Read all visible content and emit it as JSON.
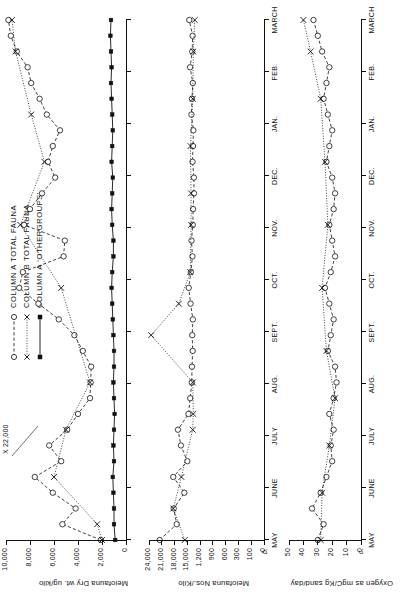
{
  "figure": {
    "legend": [
      {
        "id": "col-a-total",
        "label": "COLUMN A TOTAL  FAUNA",
        "style": "open-circle-dashed"
      },
      {
        "id": "col-b-total",
        "label": "COLUMN B TOTAL  FAUNA",
        "style": "cross-dotted"
      },
      {
        "id": "col-a-other",
        "label": "COLUMN A  ‘OTHERGROUPS’",
        "style": "filled-square-solid"
      }
    ],
    "annotation": {
      "text": "X 22,000",
      "panel": "a"
    },
    "panel_letters": {
      "b": "b.",
      "c": "c."
    }
  },
  "chart_data": [
    {
      "type": "line",
      "panel": "a",
      "title": "",
      "ylabel": "Meiofauna Dry wt. ug/kilo",
      "xlabel": "",
      "grid": false,
      "legend_position": "top-left",
      "ylim": [
        0,
        10500
      ],
      "yticks": [
        0,
        2000,
        4000,
        6000,
        8000,
        10000
      ],
      "ytick_labels": [
        "0",
        "2,000",
        "4,000",
        "6,000",
        "8,000",
        "10,000"
      ],
      "x": [
        "MAY",
        "JUNE",
        "JULY",
        "AUG.",
        "SEPT.",
        "OCT.",
        "NOV.",
        "DEC.",
        "JAN.",
        "FEB.",
        "MARCH"
      ],
      "xtick_labels": [
        "MAY",
        "JUNE",
        "JULY",
        "AUG.",
        "SEPT.",
        "OCT.",
        "NOV.",
        "DEC.",
        "JAN.",
        "FEB.",
        "MARCH"
      ],
      "series": [
        {
          "name": "COLUMN A TOTAL FAUNA",
          "marker": "open-circle",
          "line": "dashed",
          "values": [
            2100,
            5300,
            4200,
            6100,
            7600,
            5400,
            6400,
            4900,
            4000,
            3000,
            2950,
            2900,
            3600,
            4300,
            5600,
            7300,
            8900,
            8600,
            5200,
            5100,
            8500,
            8000,
            7000,
            5900,
            6500,
            6100,
            5500,
            6600,
            7200,
            7900,
            8200,
            9100,
            9600,
            9800
          ]
        },
        {
          "name": "COLUMN B TOTAL FAUNA",
          "marker": "cross",
          "line": "dotted",
          "values": [
            2000,
            2400,
            null,
            null,
            6000,
            null,
            null,
            5000,
            null,
            null,
            3000,
            null,
            null,
            null,
            null,
            null,
            5400,
            null,
            null,
            null,
            8800,
            null,
            null,
            null,
            6800,
            null,
            null,
            7900,
            null,
            null,
            null,
            9200,
            null,
            9500
          ]
        },
        {
          "name": "COLUMN A ‘OTHERGROUPS’",
          "marker": "filled-square",
          "line": "solid",
          "values": [
            900,
            1000,
            1000,
            1050,
            1100,
            1000,
            1050,
            1000,
            950,
            1000,
            1050,
            1000,
            1000,
            1050,
            1100,
            1150,
            1200,
            1150,
            1050,
            1050,
            1150,
            1200,
            1150,
            1100,
            1200,
            1150,
            1100,
            1150,
            1200,
            1250,
            1200,
            1250,
            1300,
            1250
          ]
        }
      ]
    },
    {
      "type": "line",
      "panel": "b",
      "title": "",
      "ylabel": "Meiofauna Nos./Kilo",
      "xlabel": "",
      "grid": false,
      "axis_break": true,
      "ylim": [
        0,
        24000
      ],
      "yticks": [
        0,
        100,
        300,
        600,
        900,
        1200,
        15000,
        18000,
        21000,
        24000
      ],
      "ytick_labels": [
        "0",
        "100",
        "300",
        "600",
        "900",
        "1,200",
        "15,000",
        "18,000",
        "21,000",
        "24,000"
      ],
      "x": [
        "MAY",
        "JUNE",
        "JULY",
        "AUG.",
        "SEPT.",
        "OCT.",
        "NOV.",
        "DEC.",
        "JAN.",
        "FEB.",
        "MARCH"
      ],
      "xtick_labels": [
        "MAY",
        "JUNE",
        "JULY",
        "AUG.",
        "SEPT.",
        "OCT.",
        "NOV.",
        "DEC.",
        "JAN.",
        "FEB.",
        "MARCH"
      ],
      "series": [
        {
          "name": "COLUMN A TOTAL FAUNA",
          "marker": "open-circle",
          "line": "dashed",
          "values": [
            21500,
            17500,
            18200,
            15700,
            18300,
            15000,
            16500,
            17200,
            13800,
            11900,
            10200,
            10000,
            9200,
            9700,
            9000,
            11500,
            13500,
            11200,
            9500,
            10500,
            9100,
            8800,
            7800,
            7900,
            9400,
            8900,
            8500,
            10600,
            10000,
            9100,
            12000,
            9700,
            9300,
            12900
          ]
        },
        {
          "name": "COLUMN B TOTAL FAUNA",
          "marker": "cross",
          "line": "dotted",
          "values": [
            15600,
            null,
            18300,
            null,
            16400,
            null,
            null,
            9200,
            8600,
            null,
            9100,
            null,
            null,
            23500,
            null,
            17000,
            null,
            11800,
            null,
            null,
            10900,
            null,
            11000,
            null,
            null,
            11600,
            null,
            null,
            9100,
            null,
            null,
            8600,
            null,
            7000
          ]
        },
        {
          "name": "COLUMN A ‘OTHERGROUPS’",
          "marker": "open-circle",
          "line": "solid",
          "values": [
            null,
            null,
            null,
            null,
            null,
            null,
            null,
            null,
            null,
            null,
            null,
            null,
            null,
            null,
            null,
            null,
            null,
            null,
            null,
            null,
            null,
            null,
            null,
            null,
            null,
            null,
            null,
            null,
            null,
            null,
            null,
            null,
            null,
            null
          ]
        }
      ]
    },
    {
      "type": "line",
      "panel": "c",
      "title": "",
      "ylabel": "Oxygen as mgC/Kg sand/day",
      "xlabel": "",
      "grid": false,
      "ylim": [
        0,
        52
      ],
      "yticks": [
        0,
        10,
        20,
        30,
        40,
        50
      ],
      "ytick_labels": [
        "0",
        "10",
        "20",
        "30",
        "40",
        "50"
      ],
      "x": [
        "MAY",
        "JUNE",
        "JULY",
        "AUG.",
        "SEPT.",
        "OCT.",
        "NOV.",
        "DEC.",
        "JAN.",
        "FEB.",
        "MARCH"
      ],
      "xtick_labels": [
        "MAY",
        "JUNE",
        "JULY",
        "AUG.",
        "SEPT.",
        "OCT.",
        "NOV.",
        "DEC.",
        "JAN.",
        "FEB.",
        "MARCH"
      ],
      "series": [
        {
          "name": "COLUMN A TOTAL FAUNA",
          "marker": "open-circle",
          "line": "dashed",
          "values": [
            30,
            26,
            34,
            28,
            24,
            20,
            21,
            19,
            22,
            19,
            17,
            18,
            23,
            21,
            19,
            22,
            25,
            21,
            18,
            20,
            22,
            19,
            18,
            20,
            24,
            22,
            20,
            23,
            26,
            24,
            22,
            27,
            30,
            33
          ]
        },
        {
          "name": "COLUMN B TOTAL FAUNA",
          "marker": "cross",
          "line": "dotted",
          "values": [
            28,
            null,
            null,
            27,
            null,
            null,
            22,
            null,
            null,
            18,
            null,
            null,
            24,
            null,
            null,
            null,
            27,
            null,
            null,
            null,
            23,
            null,
            null,
            null,
            25,
            null,
            null,
            null,
            28,
            null,
            null,
            35,
            null,
            40
          ]
        }
      ]
    }
  ]
}
